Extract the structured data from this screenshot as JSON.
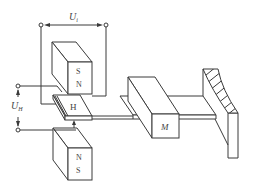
{
  "diagram": {
    "labels": {
      "control_voltage": "U",
      "control_voltage_sub": "i",
      "hall_voltage": "U",
      "hall_voltage_sub": "H",
      "hall_element": "H",
      "mass": "M",
      "top_magnet_upper": "S",
      "top_magnet_lower": "N",
      "bottom_magnet_upper": "N",
      "bottom_magnet_lower": "S"
    },
    "colors": {
      "line": "#3a3a3a",
      "background": "#ffffff"
    }
  }
}
